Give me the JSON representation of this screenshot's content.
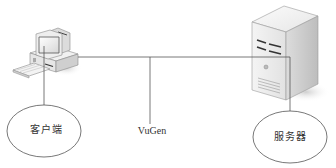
{
  "diagram": {
    "type": "network-topology",
    "nodes": {
      "client": {
        "label": "客户端",
        "icon": "desktop-computer-icon"
      },
      "vugen": {
        "label": "VuGen"
      },
      "server": {
        "label": "服务器",
        "icon": "server-tower-icon"
      }
    },
    "edges": [
      {
        "from": "client",
        "to": "server",
        "style": "line"
      },
      {
        "from": "vugen",
        "to": "bus",
        "style": "line"
      }
    ],
    "colors": {
      "line": "#555555",
      "ellipse_stroke": "#555555",
      "background": "#ffffff",
      "text": "#333333"
    }
  }
}
